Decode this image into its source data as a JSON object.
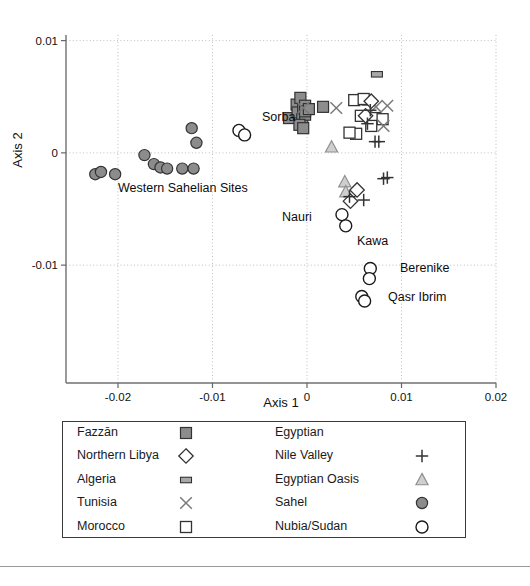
{
  "figure": {
    "axes": {
      "xlabel": "Axis 1",
      "ylabel": "Axis 2",
      "xticks": [
        "-0.02",
        "-0.01",
        "0",
        "0.01",
        "0.02"
      ],
      "yticks": [
        "0.01",
        "0",
        "-0.01"
      ]
    },
    "annotations": [
      {
        "name": "sorba",
        "text": "Sorba",
        "x": 262,
        "y": 121
      },
      {
        "name": "western-sahel",
        "text": "Western Sahelian Sites",
        "x": 118,
        "y": 192
      },
      {
        "name": "nauri",
        "text": "Nauri",
        "x": 282,
        "y": 221
      },
      {
        "name": "kawa",
        "text": "Kawa",
        "x": 357,
        "y": 245
      },
      {
        "name": "berenike",
        "text": "Berenike",
        "x": 400,
        "y": 272
      },
      {
        "name": "qasr-ibrim",
        "text": "Qasr Ibrim",
        "x": 388,
        "y": 301
      }
    ]
  },
  "legend": {
    "left_column": [
      {
        "label": "Fazzān",
        "symbol": "filled-square"
      },
      {
        "label": "Northern Libya",
        "symbol": "open-diamond"
      },
      {
        "label": "Algeria",
        "symbol": "filled-rect"
      },
      {
        "label": "Tunisia",
        "symbol": "cross-x"
      },
      {
        "label": "Morocco",
        "symbol": "open-square"
      }
    ],
    "right_column": [
      {
        "label": "Egyptian",
        "symbol": "none"
      },
      {
        "label": "Nile Valley",
        "symbol": "plus"
      },
      {
        "label": "Egyptian Oasis",
        "symbol": "open-triangle"
      },
      {
        "label": "Sahel",
        "symbol": "filled-circle"
      },
      {
        "label": "Nubia/Sudan",
        "symbol": "open-circle"
      }
    ]
  },
  "colors": {
    "fill_gray": "#8c8c8c",
    "light_gray": "#a8a8a8",
    "stroke_dark": "#333333",
    "grid": "#bdbdbd",
    "axis": "#666666"
  },
  "chart_data": {
    "type": "scatter",
    "title": "",
    "xlabel": "Axis 1",
    "ylabel": "Axis 2",
    "xlim": [
      -0.0255,
      0.02
    ],
    "ylim": [
      -0.0205,
      0.0105
    ],
    "xticks": [
      -0.02,
      -0.01,
      0,
      0.01,
      0.02
    ],
    "yticks": [
      0.01,
      0,
      -0.01
    ],
    "grid": true,
    "legend_position": "below-plot",
    "series": [
      {
        "name": "Fazzān",
        "marker": "filled-square",
        "color": "#8c8c8c",
        "points": [
          [
            -0.0019,
            0.0031
          ],
          [
            -0.0011,
            0.0043
          ],
          [
            -0.0007,
            0.0049
          ],
          [
            -0.001,
            0.0036
          ],
          [
            -0.0004,
            0.0039
          ],
          [
            -0.0002,
            0.0042
          ],
          [
            -0.0005,
            0.003
          ],
          [
            -0.0002,
            0.0034
          ],
          [
            -0.0008,
            0.0025
          ],
          [
            -0.0004,
            0.0022
          ],
          [
            -0.0002,
            0.0037
          ],
          [
            0.0002,
            0.0039
          ],
          [
            0.0017,
            0.0041
          ]
        ]
      },
      {
        "name": "Algeria",
        "marker": "filled-rect",
        "color": "#a8a8a8",
        "points": [
          [
            0.0074,
            0.007
          ],
          [
            0.0064,
            0.0045
          ]
        ]
      },
      {
        "name": "Northern Libya",
        "marker": "open-diamond",
        "color": "#ffffff",
        "points": [
          [
            0.0068,
            0.0046
          ],
          [
            0.0062,
            0.0033
          ],
          [
            0.0053,
            -0.0033
          ],
          [
            0.0046,
            -0.0043
          ]
        ]
      },
      {
        "name": "Tunisia",
        "marker": "cross-x",
        "color": "#7a7a7a",
        "points": [
          [
            -0.0004,
            0.004
          ],
          [
            0.0031,
            0.004
          ],
          [
            0.0073,
            0.0041
          ],
          [
            0.0081,
            0.0024
          ],
          [
            0.0085,
            0.0042
          ]
        ]
      },
      {
        "name": "Morocco",
        "marker": "open-square",
        "color": "#ffffff",
        "points": [
          [
            0.005,
            0.0047
          ],
          [
            0.006,
            0.0048
          ],
          [
            0.0072,
            0.0031
          ],
          [
            0.008,
            0.003
          ],
          [
            0.0057,
            0.0033
          ],
          [
            0.0068,
            0.0024
          ],
          [
            0.0052,
            0.0017
          ],
          [
            0.0045,
            0.0018
          ]
        ]
      },
      {
        "name": "Nile Valley / Egyptian",
        "marker": "plus",
        "color": "#333333",
        "points": [
          [
            0.0067,
            0.0038
          ],
          [
            0.0064,
            0.0026
          ],
          [
            0.0072,
            0.001
          ],
          [
            0.0076,
            0.001
          ],
          [
            0.0081,
            -0.0023
          ],
          [
            0.0085,
            -0.0022
          ],
          [
            0.0045,
            -0.0039
          ],
          [
            0.006,
            -0.0042
          ]
        ]
      },
      {
        "name": "Egyptian Oasis",
        "marker": "open-triangle",
        "color": "#b0b0b0",
        "points": [
          [
            0.0026,
            0.0005
          ],
          [
            0.004,
            -0.0026
          ],
          [
            0.0041,
            -0.0035
          ]
        ]
      },
      {
        "name": "Sahel",
        "marker": "filled-circle",
        "color": "#8c8c8c",
        "points": [
          [
            -0.0224,
            -0.0019
          ],
          [
            -0.0218,
            -0.0017
          ],
          [
            -0.0203,
            -0.0019
          ],
          [
            -0.0172,
            -0.0002
          ],
          [
            -0.0162,
            -0.001
          ],
          [
            -0.0155,
            -0.0013
          ],
          [
            -0.0148,
            -0.0014
          ],
          [
            -0.0132,
            -0.0014
          ],
          [
            -0.012,
            -0.0014
          ],
          [
            -0.0122,
            0.0022
          ],
          [
            -0.0117,
            0.0009
          ]
        ]
      },
      {
        "name": "Nubia/Sudan",
        "marker": "open-circle",
        "color": "#ffffff",
        "points": [
          [
            -0.0072,
            0.002
          ],
          [
            -0.0066,
            0.0016
          ],
          [
            0.0037,
            -0.0055
          ],
          [
            0.0041,
            -0.0065
          ],
          [
            0.0067,
            -0.0103
          ],
          [
            0.0066,
            -0.0112
          ],
          [
            0.0058,
            -0.0128
          ],
          [
            0.0061,
            -0.0132
          ]
        ]
      }
    ],
    "annotations": [
      {
        "text": "Sorba",
        "x": -0.0057,
        "y": 0.002
      },
      {
        "text": "Western Sahelian Sites",
        "x": -0.0195,
        "y": -0.0035
      },
      {
        "text": "Nauri",
        "x": 0.0021,
        "y": -0.0057
      },
      {
        "text": "Kawa",
        "x": 0.0048,
        "y": -0.0066
      },
      {
        "text": "Berenike",
        "x": 0.0078,
        "y": -0.0104
      },
      {
        "text": "Qasr Ibrim",
        "x": 0.0068,
        "y": -0.0129
      }
    ]
  }
}
